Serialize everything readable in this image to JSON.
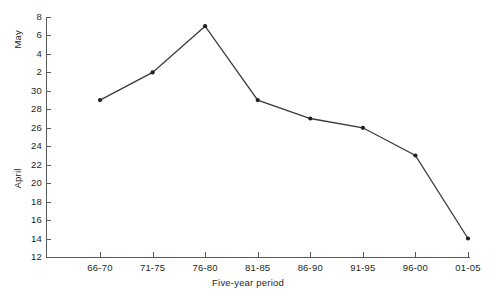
{
  "chart_data": {
    "type": "line",
    "title": "",
    "subtitle": "",
    "xlabel": "Five-year period",
    "ylabel_upper": "May",
    "ylabel_lower": "April",
    "categories": [
      "66-70",
      "71-75",
      "76-80",
      "81-85",
      "86-90",
      "91-95",
      "96-00",
      "01-05"
    ],
    "values": [
      29,
      32,
      37,
      29,
      27,
      26,
      23,
      14
    ],
    "value_labels": [
      "April 29",
      "May 2",
      "May 7",
      "April 29",
      "April 27",
      "April 26",
      "April 23",
      "April 14"
    ],
    "series": [
      {
        "name": "Mean date",
        "values": [
          29,
          32,
          37,
          29,
          27,
          26,
          23,
          14
        ]
      }
    ],
    "ytick_values": [
      12,
      14,
      16,
      18,
      20,
      22,
      24,
      26,
      28,
      30,
      32,
      34,
      36,
      38
    ],
    "ytick_labels": [
      "12",
      "14",
      "16",
      "18",
      "20",
      "22",
      "24",
      "26",
      "28",
      "30",
      "2",
      "4",
      "6",
      "8"
    ],
    "ylim": [
      12,
      38
    ],
    "grid": false,
    "legend": false,
    "legend_position": "none",
    "line_color": "#3a3a3c",
    "marker_color": "#231f20",
    "axis_color": "#58595b",
    "background_color": "#ffffff"
  }
}
